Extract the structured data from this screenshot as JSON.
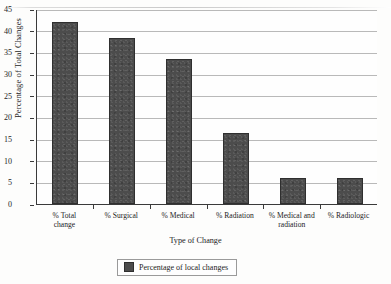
{
  "figure": {
    "cropped_header_text": "",
    "y_axis_label": "Percentage of Total Changes",
    "x_axis_label": "Type of Change",
    "legend_label": "Percentage of local changes",
    "bar_color": "#4c4c4c",
    "gridline_color": "#b9b9b9",
    "axis_color": "#3a3a3a"
  },
  "chart_data": {
    "type": "bar",
    "title": "",
    "xlabel": "Type of Change",
    "ylabel": "Percentage of Total Changes",
    "ylim": [
      0,
      45
    ],
    "ytick_step": 5,
    "yticks": [
      0,
      5,
      10,
      15,
      20,
      25,
      30,
      35,
      40,
      45
    ],
    "ytick_labels": [
      "0",
      "5",
      "10",
      "15",
      "20",
      "25",
      "30",
      "35",
      "40",
      "45"
    ],
    "grid": true,
    "legend_position": "bottom-center",
    "categories": [
      "% Total change",
      "% Surgical",
      "% Medical",
      "% Radiation",
      "% Medical and radiation",
      "% Radiologic"
    ],
    "category_lines": [
      [
        "% Total",
        "change"
      ],
      [
        "% Surgical"
      ],
      [
        "% Medical"
      ],
      [
        "% Radiation"
      ],
      [
        "% Medical and",
        "radiation"
      ],
      [
        "% Radiologic"
      ]
    ],
    "series": [
      {
        "name": "Percentage of local changes",
        "values": [
          42,
          38.3,
          33.5,
          16.5,
          6,
          6
        ]
      }
    ]
  }
}
